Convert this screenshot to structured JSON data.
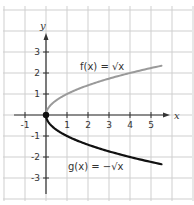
{
  "chart_data": {
    "type": "line",
    "title": "",
    "xlabel": "x",
    "ylabel": "y",
    "xlim": [
      -2,
      7
    ],
    "ylim": [
      -4,
      5
    ],
    "grid": true,
    "x_ticks": [
      -1,
      1,
      2,
      3,
      4,
      5
    ],
    "y_ticks": [
      -3,
      -2,
      -1,
      1,
      2,
      3
    ],
    "x_tick_labels": [
      "-1",
      "1",
      "2",
      "3",
      "4",
      "5"
    ],
    "y_tick_labels": [
      "-3",
      "-2",
      "-1",
      "1",
      "2",
      "3"
    ],
    "series": [
      {
        "name": "f(x) = √x",
        "label_text": "f(x) = √x",
        "color": "#9a9a9a",
        "x": [
          0,
          0.25,
          0.5,
          1,
          1.5,
          2,
          2.5,
          3,
          3.5,
          4,
          4.5,
          5,
          5.5
        ],
        "values": [
          0,
          0.5,
          0.71,
          1,
          1.22,
          1.41,
          1.58,
          1.73,
          1.87,
          2,
          2.12,
          2.24,
          2.35
        ]
      },
      {
        "name": "g(x) = -√x",
        "label_text": "g(x) = −√x",
        "color": "#111111",
        "x": [
          0,
          0.25,
          0.5,
          1,
          1.5,
          2,
          2.5,
          3,
          3.5,
          4,
          4.5,
          5,
          5.5
        ],
        "values": [
          0,
          -0.5,
          -0.71,
          -1,
          -1.22,
          -1.41,
          -1.58,
          -1.73,
          -1.87,
          -2,
          -2.12,
          -2.24,
          -2.35
        ]
      }
    ],
    "annotations": [
      {
        "text": "f(x) = √x",
        "x": 3,
        "y": 2.3
      },
      {
        "text": "g(x) = −√x",
        "x": 3,
        "y": -2.6
      }
    ],
    "points": [
      {
        "x": 0,
        "y": 0,
        "style": "filled-circle"
      }
    ],
    "legend": "none (inline labels)"
  },
  "labels": {
    "x_axis": "x",
    "y_axis": "y",
    "f_label": "f(x) = √x",
    "g_label": "g(x) = −√x"
  }
}
